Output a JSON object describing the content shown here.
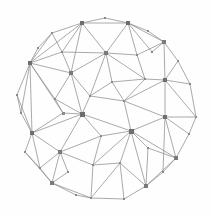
{
  "figure": {
    "width": 212,
    "height": 218,
    "background_color": "#fefefe"
  },
  "style": {
    "edge_color": "#8d8d8d",
    "edge_width": 0.75,
    "node_color_small": "#8a8a8a",
    "node_color_medium": "#7a7a7a",
    "node_color_hub": "#6e6e6e"
  },
  "chart_data": {
    "type": "scatter",
    "xlabel": "",
    "ylabel": "",
    "xlim": [
      0,
      212
    ],
    "ylim": [
      0,
      218
    ],
    "grid": false,
    "legend": "none",
    "node_count": 45,
    "edge_count": 118,
    "nodes": [
      {
        "id": 0,
        "x": 82,
        "y": 23,
        "size": 4.2,
        "class": "hub"
      },
      {
        "id": 1,
        "x": 105,
        "y": 18,
        "size": 2.2,
        "class": "small"
      },
      {
        "id": 2,
        "x": 128,
        "y": 23,
        "size": 4.2,
        "class": "hub"
      },
      {
        "id": 3,
        "x": 52,
        "y": 33,
        "size": 2.4,
        "class": "small"
      },
      {
        "id": 4,
        "x": 148,
        "y": 31,
        "size": 2.2,
        "class": "small"
      },
      {
        "id": 5,
        "x": 164,
        "y": 42,
        "size": 3.6,
        "class": "medium"
      },
      {
        "id": 6,
        "x": 62,
        "y": 52,
        "size": 2.6,
        "class": "small"
      },
      {
        "id": 7,
        "x": 106,
        "y": 53,
        "size": 3.8,
        "class": "medium"
      },
      {
        "id": 8,
        "x": 137,
        "y": 55,
        "size": 2.8,
        "class": "small"
      },
      {
        "id": 9,
        "x": 30,
        "y": 63,
        "size": 4.6,
        "class": "hub"
      },
      {
        "id": 10,
        "x": 71,
        "y": 73,
        "size": 3.4,
        "class": "medium"
      },
      {
        "id": 11,
        "x": 178,
        "y": 61,
        "size": 2.2,
        "class": "small"
      },
      {
        "id": 12,
        "x": 145,
        "y": 79,
        "size": 2.6,
        "class": "small"
      },
      {
        "id": 13,
        "x": 165,
        "y": 80,
        "size": 4.4,
        "class": "hub"
      },
      {
        "id": 14,
        "x": 190,
        "y": 84,
        "size": 2.4,
        "class": "small"
      },
      {
        "id": 15,
        "x": 17,
        "y": 95,
        "size": 2.4,
        "class": "small"
      },
      {
        "id": 16,
        "x": 55,
        "y": 99,
        "size": 2.6,
        "class": "small"
      },
      {
        "id": 17,
        "x": 90,
        "y": 96,
        "size": 2.6,
        "class": "small"
      },
      {
        "id": 18,
        "x": 124,
        "y": 101,
        "size": 2.6,
        "class": "small"
      },
      {
        "id": 19,
        "x": 63,
        "y": 113,
        "size": 3.0,
        "class": "small"
      },
      {
        "id": 20,
        "x": 82,
        "y": 114,
        "size": 5.0,
        "class": "hub"
      },
      {
        "id": 21,
        "x": 165,
        "y": 117,
        "size": 4.4,
        "class": "hub"
      },
      {
        "id": 22,
        "x": 196,
        "y": 117,
        "size": 2.4,
        "class": "small"
      },
      {
        "id": 23,
        "x": 131,
        "y": 131,
        "size": 5.0,
        "class": "hub"
      },
      {
        "id": 24,
        "x": 32,
        "y": 133,
        "size": 4.6,
        "class": "hub"
      },
      {
        "id": 25,
        "x": 101,
        "y": 136,
        "size": 2.4,
        "class": "small"
      },
      {
        "id": 26,
        "x": 60,
        "y": 152,
        "size": 3.6,
        "class": "medium"
      },
      {
        "id": 27,
        "x": 25,
        "y": 152,
        "size": 2.2,
        "class": "small"
      },
      {
        "id": 28,
        "x": 120,
        "y": 163,
        "size": 2.6,
        "class": "small"
      },
      {
        "id": 29,
        "x": 93,
        "y": 165,
        "size": 2.4,
        "class": "small"
      },
      {
        "id": 30,
        "x": 176,
        "y": 158,
        "size": 3.4,
        "class": "medium"
      },
      {
        "id": 31,
        "x": 52,
        "y": 183,
        "size": 3.4,
        "class": "medium"
      },
      {
        "id": 32,
        "x": 76,
        "y": 195,
        "size": 2.2,
        "class": "small"
      },
      {
        "id": 33,
        "x": 91,
        "y": 198,
        "size": 2.8,
        "class": "small"
      },
      {
        "id": 34,
        "x": 124,
        "y": 199,
        "size": 2.4,
        "class": "small"
      },
      {
        "id": 35,
        "x": 146,
        "y": 186,
        "size": 3.8,
        "class": "medium"
      },
      {
        "id": 36,
        "x": 163,
        "y": 172,
        "size": 2.2,
        "class": "small"
      },
      {
        "id": 37,
        "x": 40,
        "y": 168,
        "size": 2.0,
        "class": "small"
      },
      {
        "id": 38,
        "x": 152,
        "y": 52,
        "size": 2.0,
        "class": "small"
      },
      {
        "id": 39,
        "x": 38,
        "y": 48,
        "size": 2.0,
        "class": "small"
      },
      {
        "id": 40,
        "x": 21,
        "y": 113,
        "size": 2.0,
        "class": "small"
      },
      {
        "id": 41,
        "x": 189,
        "y": 134,
        "size": 2.0,
        "class": "small"
      },
      {
        "id": 42,
        "x": 112,
        "y": 82,
        "size": 2.4,
        "class": "small"
      },
      {
        "id": 43,
        "x": 148,
        "y": 148,
        "size": 2.2,
        "class": "small"
      },
      {
        "id": 44,
        "x": 68,
        "y": 172,
        "size": 2.0,
        "class": "small"
      }
    ],
    "edges": [
      [
        0,
        1
      ],
      [
        1,
        2
      ],
      [
        0,
        2
      ],
      [
        0,
        3
      ],
      [
        3,
        9
      ],
      [
        0,
        6
      ],
      [
        0,
        7
      ],
      [
        0,
        9
      ],
      [
        0,
        10
      ],
      [
        2,
        4
      ],
      [
        4,
        5
      ],
      [
        2,
        5
      ],
      [
        2,
        7
      ],
      [
        2,
        8
      ],
      [
        2,
        38
      ],
      [
        5,
        38
      ],
      [
        5,
        11
      ],
      [
        5,
        13
      ],
      [
        5,
        8
      ],
      [
        8,
        7
      ],
      [
        8,
        12
      ],
      [
        7,
        12
      ],
      [
        7,
        42
      ],
      [
        7,
        10
      ],
      [
        7,
        17
      ],
      [
        7,
        6
      ],
      [
        3,
        6
      ],
      [
        6,
        9
      ],
      [
        6,
        10
      ],
      [
        39,
        9
      ],
      [
        3,
        39
      ],
      [
        9,
        10
      ],
      [
        9,
        16
      ],
      [
        9,
        15
      ],
      [
        9,
        19
      ],
      [
        9,
        24
      ],
      [
        9,
        40
      ],
      [
        15,
        40
      ],
      [
        15,
        24
      ],
      [
        40,
        24
      ],
      [
        10,
        16
      ],
      [
        10,
        17
      ],
      [
        10,
        20
      ],
      [
        11,
        13
      ],
      [
        11,
        14
      ],
      [
        13,
        14
      ],
      [
        13,
        12
      ],
      [
        13,
        18
      ],
      [
        13,
        21
      ],
      [
        13,
        22
      ],
      [
        14,
        22
      ],
      [
        12,
        18
      ],
      [
        12,
        42
      ],
      [
        42,
        17
      ],
      [
        42,
        18
      ],
      [
        17,
        20
      ],
      [
        17,
        18
      ],
      [
        18,
        23
      ],
      [
        18,
        21
      ],
      [
        16,
        19
      ],
      [
        16,
        20
      ],
      [
        19,
        20
      ],
      [
        19,
        24
      ],
      [
        20,
        25
      ],
      [
        20,
        23
      ],
      [
        20,
        26
      ],
      [
        20,
        24
      ],
      [
        21,
        22
      ],
      [
        21,
        23
      ],
      [
        21,
        30
      ],
      [
        21,
        41
      ],
      [
        22,
        41
      ],
      [
        41,
        30
      ],
      [
        23,
        25
      ],
      [
        23,
        28
      ],
      [
        23,
        30
      ],
      [
        23,
        43
      ],
      [
        23,
        35
      ],
      [
        43,
        30
      ],
      [
        43,
        35
      ],
      [
        24,
        26
      ],
      [
        24,
        27
      ],
      [
        24,
        37
      ],
      [
        27,
        37
      ],
      [
        27,
        31
      ],
      [
        37,
        31
      ],
      [
        26,
        29
      ],
      [
        26,
        31
      ],
      [
        26,
        44
      ],
      [
        44,
        31
      ],
      [
        25,
        26
      ],
      [
        25,
        29
      ],
      [
        29,
        28
      ],
      [
        28,
        35
      ],
      [
        28,
        33
      ],
      [
        29,
        33
      ],
      [
        31,
        32
      ],
      [
        32,
        33
      ],
      [
        33,
        34
      ],
      [
        34,
        35
      ],
      [
        35,
        36
      ],
      [
        36,
        30
      ],
      [
        30,
        36
      ],
      [
        31,
        44
      ],
      [
        26,
        37
      ],
      [
        33,
        28
      ],
      [
        34,
        28
      ],
      [
        23,
        29
      ],
      [
        20,
        17
      ],
      [
        13,
        21
      ],
      [
        9,
        6
      ],
      [
        35,
        34
      ],
      [
        31,
        33
      ],
      [
        21,
        36
      ],
      [
        30,
        35
      ],
      [
        2,
        0
      ],
      [
        5,
        2
      ],
      [
        20,
        19
      ]
    ]
  }
}
